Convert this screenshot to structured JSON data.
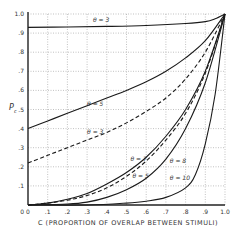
{
  "chart_data": {
    "type": "line",
    "title": "",
    "xlabel": "C  (PROPORTION OF OVERLAP BETWEEN STIMULI)",
    "ylabel": "P_c",
    "xlim": [
      0,
      1.0
    ],
    "ylim": [
      0,
      1.0
    ],
    "grid": true,
    "legend": "inline labels",
    "x_ticks": [
      "0",
      ".1",
      ".2",
      ".3",
      ".4",
      ".5",
      ".6",
      ".7",
      ".8",
      ".9",
      "1.0"
    ],
    "y_ticks": [
      "0",
      ".1",
      ".2",
      ".3",
      ".4",
      ".5",
      ".6",
      ".7",
      ".8",
      ".9",
      "1.0"
    ],
    "series": [
      {
        "name": "θ = 3",
        "style": "solid",
        "label_pos": [
          0.33,
          0.96
        ],
        "x": [
          0,
          0.2,
          0.4,
          0.6,
          0.8,
          0.9,
          0.95,
          1.0
        ],
        "y": [
          0.93,
          0.932,
          0.935,
          0.94,
          0.95,
          0.96,
          0.975,
          1.0
        ]
      },
      {
        "name": "θ = 5",
        "style": "solid",
        "label_pos": [
          0.3,
          0.52
        ],
        "x": [
          0,
          0.1,
          0.2,
          0.3,
          0.4,
          0.5,
          0.6,
          0.7,
          0.8,
          0.9,
          1.0
        ],
        "y": [
          0.4,
          0.44,
          0.48,
          0.52,
          0.56,
          0.6,
          0.645,
          0.7,
          0.77,
          0.86,
          1.0
        ]
      },
      {
        "name": "θ = 3",
        "style": "dashed",
        "label_pos": [
          0.3,
          0.37
        ],
        "x": [
          0,
          0.1,
          0.2,
          0.3,
          0.4,
          0.5,
          0.6,
          0.7,
          0.8,
          0.9,
          1.0
        ],
        "y": [
          0.22,
          0.26,
          0.3,
          0.34,
          0.38,
          0.43,
          0.49,
          0.56,
          0.66,
          0.8,
          1.0
        ]
      },
      {
        "name": "θ = 7",
        "style": "solid",
        "label_pos": [
          0.52,
          0.23
        ],
        "x": [
          0,
          0.1,
          0.2,
          0.3,
          0.4,
          0.5,
          0.6,
          0.7,
          0.8,
          0.9,
          1.0
        ],
        "y": [
          0.0,
          0.01,
          0.03,
          0.06,
          0.11,
          0.17,
          0.25,
          0.36,
          0.5,
          0.7,
          1.0
        ]
      },
      {
        "name": "θ = 5",
        "style": "dashed",
        "label_pos": [
          0.53,
          0.14
        ],
        "x": [
          0,
          0.1,
          0.2,
          0.3,
          0.4,
          0.5,
          0.6,
          0.7,
          0.8,
          0.9,
          1.0
        ],
        "y": [
          0.0,
          0.01,
          0.025,
          0.05,
          0.09,
          0.15,
          0.23,
          0.34,
          0.48,
          0.69,
          1.0
        ]
      },
      {
        "name": "θ = 8",
        "style": "solid",
        "label_pos": [
          0.72,
          0.22
        ],
        "x": [
          0,
          0.2,
          0.3,
          0.4,
          0.5,
          0.6,
          0.7,
          0.8,
          0.9,
          1.0
        ],
        "y": [
          0.0,
          0.005,
          0.015,
          0.04,
          0.08,
          0.14,
          0.24,
          0.4,
          0.64,
          1.0
        ]
      },
      {
        "name": "θ = 10",
        "style": "solid",
        "label_pos": [
          0.72,
          0.13
        ],
        "x": [
          0,
          0.3,
          0.5,
          0.6,
          0.7,
          0.8,
          0.85,
          0.9,
          0.95,
          1.0
        ],
        "y": [
          0.0,
          0.0,
          0.01,
          0.02,
          0.04,
          0.09,
          0.16,
          0.32,
          0.58,
          1.0
        ]
      }
    ]
  }
}
